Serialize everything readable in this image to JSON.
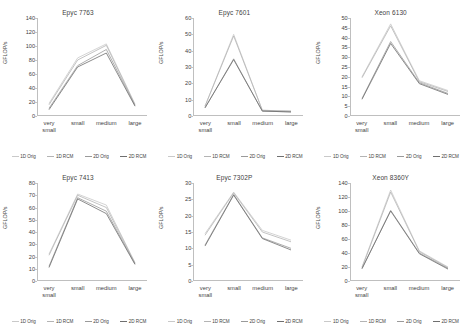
{
  "figure": {
    "ylabel": "GFLOP/s",
    "categories": [
      "very small",
      "small",
      "medium",
      "large"
    ],
    "series_names": [
      "1D Orig",
      "1D RCM",
      "2D Orig",
      "2D RCM"
    ],
    "series_colors": [
      "#c9c9c9",
      "#b4b4b4",
      "#9a9a9a",
      "#6f6f6f"
    ]
  },
  "chart_data": [
    {
      "type": "line",
      "title": "Epyc 7763",
      "categories": [
        "very small",
        "small",
        "medium",
        "large"
      ],
      "xlabel": "",
      "ylabel": "GFLOP/s",
      "ylim": [
        0,
        140
      ],
      "yticks": [
        0,
        20,
        40,
        60,
        80,
        100,
        120,
        140
      ],
      "grid": false,
      "legend_position": "bottom",
      "series": [
        {
          "name": "1D Orig",
          "values": [
            18,
            83,
            103,
            17
          ]
        },
        {
          "name": "1D RCM",
          "values": [
            16,
            80,
            101,
            16
          ]
        },
        {
          "name": "2D Orig",
          "values": [
            11,
            72,
            95,
            15
          ]
        },
        {
          "name": "2D RCM",
          "values": [
            9,
            70,
            90,
            14
          ]
        }
      ]
    },
    {
      "type": "line",
      "title": "Epyc 7601",
      "categories": [
        "very small",
        "small",
        "medium",
        "large"
      ],
      "xlabel": "",
      "ylabel": "GFLOP/s",
      "ylim": [
        0,
        60
      ],
      "yticks": [
        0,
        10,
        20,
        30,
        40,
        50,
        60
      ],
      "grid": false,
      "legend_position": "bottom",
      "series": [
        {
          "name": "1D Orig",
          "values": [
            6,
            50,
            3.5,
            3
          ]
        },
        {
          "name": "1D RCM",
          "values": [
            6,
            49,
            3.5,
            3
          ]
        },
        {
          "name": "2D Orig",
          "values": [
            5,
            35,
            3,
            2.5
          ]
        },
        {
          "name": "2D RCM",
          "values": [
            5,
            34.5,
            3,
            2.5
          ]
        }
      ]
    },
    {
      "type": "line",
      "title": "Xeon 6130",
      "categories": [
        "very small",
        "small",
        "medium",
        "large"
      ],
      "xlabel": "",
      "ylabel": "GFLOP/s",
      "ylim": [
        0,
        50
      ],
      "yticks": [
        0,
        5,
        10,
        15,
        20,
        25,
        30,
        35,
        40,
        45,
        50
      ],
      "grid": false,
      "legend_position": "bottom",
      "series": [
        {
          "name": "1D Orig",
          "values": [
            20,
            47,
            18,
            13
          ]
        },
        {
          "name": "1D RCM",
          "values": [
            19.5,
            46,
            17.5,
            12.5
          ]
        },
        {
          "name": "2D Orig",
          "values": [
            9,
            38,
            17,
            11.5
          ]
        },
        {
          "name": "2D RCM",
          "values": [
            8.5,
            37,
            16.5,
            11
          ]
        }
      ]
    },
    {
      "type": "line",
      "title": "Epyc 7413",
      "categories": [
        "very small",
        "small",
        "medium",
        "large"
      ],
      "xlabel": "",
      "ylabel": "GFLOP/s",
      "ylim": [
        0,
        80
      ],
      "yticks": [
        0,
        10,
        20,
        30,
        40,
        50,
        60,
        70,
        80
      ],
      "grid": false,
      "legend_position": "bottom",
      "series": [
        {
          "name": "1D Orig",
          "values": [
            22,
            71,
            62,
            15
          ]
        },
        {
          "name": "1D RCM",
          "values": [
            21,
            70,
            60,
            14.5
          ]
        },
        {
          "name": "2D Orig",
          "values": [
            12,
            68,
            57,
            14
          ]
        },
        {
          "name": "2D RCM",
          "values": [
            11,
            67,
            55,
            13.5
          ]
        }
      ]
    },
    {
      "type": "line",
      "title": "Epyc 7302P",
      "categories": [
        "very small",
        "small",
        "medium",
        "large"
      ],
      "xlabel": "",
      "ylabel": "GFLOP/s",
      "ylim": [
        0,
        30
      ],
      "yticks": [
        0,
        5,
        10,
        15,
        20,
        25,
        30
      ],
      "grid": false,
      "legend_position": "bottom",
      "series": [
        {
          "name": "1D Orig",
          "values": [
            14.5,
            27.2,
            15.5,
            12.5
          ]
        },
        {
          "name": "1D RCM",
          "values": [
            14,
            27,
            15,
            12
          ]
        },
        {
          "name": "2D Orig",
          "values": [
            11,
            26.5,
            13.2,
            10
          ]
        },
        {
          "name": "2D RCM",
          "values": [
            10.7,
            26.3,
            13,
            9.5
          ]
        }
      ]
    },
    {
      "type": "line",
      "title": "Xeon 8360Y",
      "categories": [
        "very small",
        "small",
        "medium",
        "large"
      ],
      "xlabel": "",
      "ylabel": "GFLOP/s",
      "ylim": [
        0,
        140
      ],
      "yticks": [
        0,
        20,
        40,
        60,
        80,
        100,
        120,
        140
      ],
      "grid": false,
      "legend_position": "bottom",
      "series": [
        {
          "name": "1D Orig",
          "values": [
            20,
            130,
            43,
            20
          ]
        },
        {
          "name": "1D RCM",
          "values": [
            19,
            127,
            42,
            19
          ]
        },
        {
          "name": "2D Orig",
          "values": [
            18,
            101,
            40,
            18
          ]
        },
        {
          "name": "2D RCM",
          "values": [
            17.5,
            100,
            39,
            17
          ]
        }
      ]
    }
  ]
}
